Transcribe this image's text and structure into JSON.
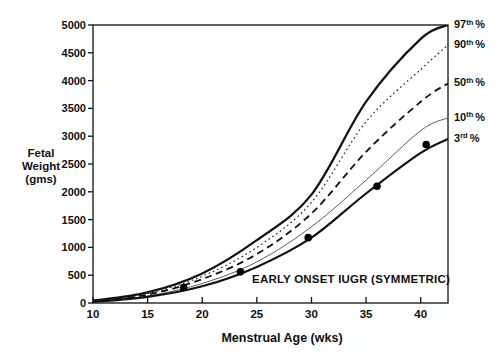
{
  "chart_data": {
    "type": "line",
    "title": "",
    "xlabel": "Menstrual Age (wks)",
    "ylabel_lines": [
      "Fetal",
      "Weight",
      "(gms)"
    ],
    "xlim": [
      10,
      42.5
    ],
    "ylim": [
      0,
      5000
    ],
    "x_ticks": [
      10,
      15,
      20,
      25,
      30,
      35,
      40
    ],
    "y_ticks": [
      0,
      500,
      1000,
      1500,
      2000,
      2500,
      3000,
      3500,
      4000,
      4500,
      5000
    ],
    "grid": false,
    "legend_position": "right-edge-labels",
    "x_samples": [
      10,
      15,
      20,
      25,
      30,
      35,
      40,
      42.5
    ],
    "series": [
      {
        "name": "97th percentile",
        "label_num": "97",
        "label_sup": "th",
        "label_pct": "%",
        "style": "solid",
        "width": 2.2,
        "color": "#111111",
        "values": [
          40,
          190,
          530,
          1130,
          1950,
          3620,
          4750,
          5000
        ]
      },
      {
        "name": "90th percentile",
        "label_num": "90",
        "label_sup": "th",
        "label_pct": "%",
        "style": "dotted",
        "width": 1.2,
        "color": "#222222",
        "values": [
          35,
          170,
          480,
          1000,
          1810,
          3260,
          4200,
          4640
        ]
      },
      {
        "name": "50th percentile",
        "label_num": "50",
        "label_sup": "th",
        "label_pct": "%",
        "style": "dashed",
        "width": 1.8,
        "color": "#111111",
        "values": [
          30,
          150,
          430,
          880,
          1610,
          2720,
          3620,
          3950
        ]
      },
      {
        "name": "10th percentile",
        "label_num": "10",
        "label_sup": "th",
        "label_pct": "%",
        "style": "solid",
        "width": 0.9,
        "color": "#4a4a4a",
        "values": [
          25,
          125,
          350,
          740,
          1370,
          2210,
          3100,
          3330
        ]
      },
      {
        "name": "3rd percentile",
        "label_num": "3",
        "label_sup": "rd",
        "label_pct": "%",
        "style": "solid",
        "width": 2.2,
        "color": "#111111",
        "values": [
          20,
          110,
          300,
          650,
          1175,
          1970,
          2700,
          2950
        ]
      }
    ],
    "scatter": {
      "name": "IUGR fetus serial weight estimates",
      "color": "#000000",
      "radius": 3.8,
      "points": [
        [
          18.3,
          280
        ],
        [
          23.5,
          560
        ],
        [
          29.7,
          1175
        ],
        [
          36.0,
          2100
        ],
        [
          40.5,
          2850
        ]
      ]
    },
    "annotation": "EARLY ONSET IUGR (SYMMETRIC)",
    "axis_color": "#111111"
  }
}
